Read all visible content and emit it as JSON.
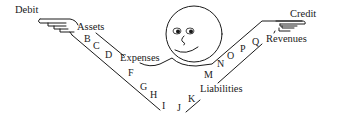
{
  "diagram": {
    "title_left": "Debit",
    "title_right": "Credit",
    "categories": {
      "assets": "Assets",
      "expenses": "Expenses",
      "liabilities": "Liabilities",
      "revenues": "Revenues"
    },
    "left_arm_letters": [
      "B",
      "C",
      "D",
      "F",
      "G",
      "H",
      "I"
    ],
    "right_arm_letters": [
      "J",
      "K",
      "M",
      "N",
      "O",
      "P",
      "Q"
    ],
    "colors": {
      "ink": "#1a1a1a",
      "background": "#ffffff"
    },
    "figure": "smiley-face-head"
  }
}
